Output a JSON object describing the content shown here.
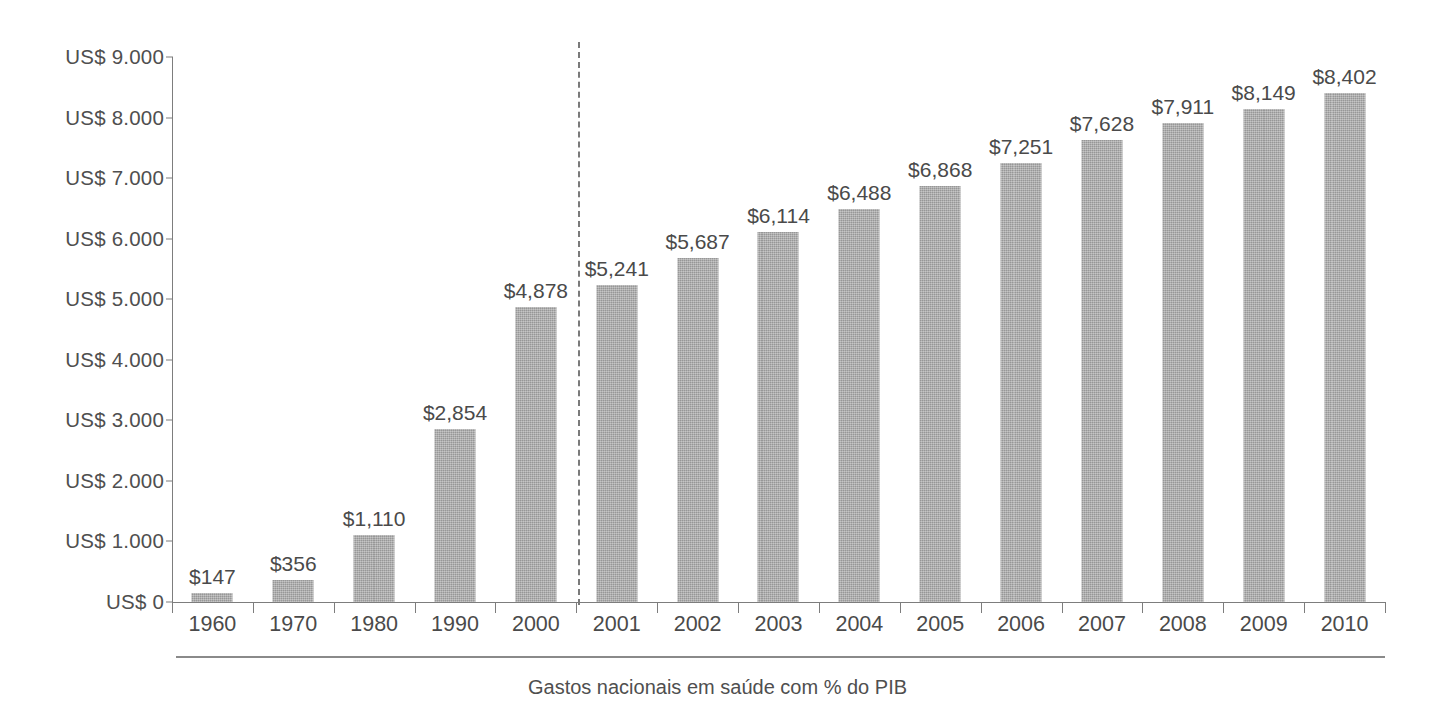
{
  "chart_data": {
    "type": "bar",
    "title": "",
    "subtitle": "",
    "caption": "Gastos nacionais em saúde com % do PIB",
    "xlabel": "",
    "ylabel": "",
    "ylim": [
      0,
      9000
    ],
    "grid": false,
    "legend": null,
    "categories": [
      "1960",
      "1970",
      "1980",
      "1990",
      "2000",
      "2001",
      "2002",
      "2003",
      "2004",
      "2005",
      "2006",
      "2007",
      "2008",
      "2009",
      "2010"
    ],
    "values": [
      147,
      356,
      1110,
      2854,
      4878,
      5241,
      5687,
      6114,
      6488,
      6868,
      7251,
      7628,
      7911,
      8149,
      8402
    ],
    "value_labels": [
      "$147",
      "$356",
      "$1,110",
      "$2,854",
      "$4,878",
      "$5,241",
      "$5,687",
      "$6,114",
      "$6,488",
      "$6,868",
      "$7,251",
      "$7,628",
      "$7,911",
      "$8,149",
      "$8,402"
    ],
    "y_ticks": [
      0,
      1000,
      2000,
      3000,
      4000,
      5000,
      6000,
      7000,
      8000,
      9000
    ],
    "y_tick_labels": [
      "US$ 0",
      "US$ 1.000",
      "US$ 2.000",
      "US$ 3.000",
      "US$ 4.000",
      "US$ 5.000",
      "US$ 6.000",
      "US$ 7.000",
      "US$ 8.000",
      "US$ 9.000"
    ],
    "annotations": [
      {
        "name": "decade-to-annual-divider",
        "type": "vertical-dashed-line",
        "between": [
          "2000",
          "2001"
        ]
      }
    ],
    "colors": {
      "bar_fill": "#a9a9a9",
      "axis": "#7d7d7d",
      "text": "#4a4a4a",
      "background": "#ffffff",
      "divider": "#7a7a7a"
    }
  }
}
